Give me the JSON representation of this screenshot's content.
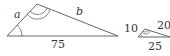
{
  "diagram": {
    "large_triangle": {
      "side_a_label": "a",
      "side_b_label": "b",
      "base_label": "75",
      "vertices": {
        "left": [
          7,
          36
        ],
        "top": [
          37,
          4
        ],
        "right": [
          118,
          36
        ]
      }
    },
    "small_triangle": {
      "left_side_label": "10",
      "right_side_label": "20",
      "base_label": "25",
      "vertices": {
        "left": [
          138,
          37
        ],
        "top": [
          145,
          29
        ],
        "right": [
          170,
          37
        ]
      }
    },
    "colors": {
      "stroke": "#666666",
      "text": "#333333"
    }
  }
}
